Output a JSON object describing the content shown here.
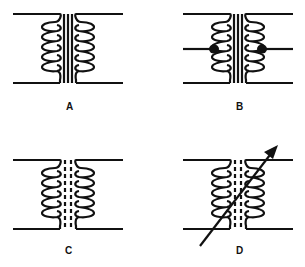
{
  "diagram": {
    "stroke_color": "#111111",
    "background": "#ffffff",
    "symbols": [
      {
        "label": "A",
        "core": "solid (iron core)",
        "turns": 5,
        "center_tap": false,
        "variable": false
      },
      {
        "label": "B",
        "core": "solid (iron core)",
        "turns": 5,
        "center_tap": true,
        "variable": false
      },
      {
        "label": "C",
        "core": "dashed (powdered-iron core)",
        "turns": 5,
        "center_tap": false,
        "variable": false
      },
      {
        "label": "D",
        "core": "dashed (powdered-iron core)",
        "turns": 5,
        "center_tap": false,
        "variable": true
      }
    ]
  }
}
